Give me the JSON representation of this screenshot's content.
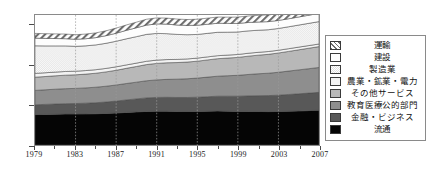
{
  "chart_data": {
    "type": "area",
    "stacked": true,
    "title": "",
    "xlabel": "",
    "ylabel": "",
    "x": [
      1979,
      1980,
      1981,
      1982,
      1983,
      1984,
      1985,
      1986,
      1987,
      1988,
      1989,
      1990,
      1991,
      1992,
      1993,
      1994,
      1995,
      1996,
      1997,
      1998,
      1999,
      2000,
      2001,
      2002,
      2003,
      2004,
      2005,
      2006,
      2007
    ],
    "xlim": [
      1979,
      2007
    ],
    "ylim": [
      0,
      3250
    ],
    "yticks": [
      0,
      1000,
      2000,
      3000
    ],
    "xticks": [
      1979,
      1983,
      1987,
      1991,
      1995,
      1999,
      2003,
      2007
    ],
    "grid": "vertical-dotted",
    "legend_position": "right",
    "series": [
      {
        "name": "流通",
        "order_from_bottom": 1,
        "color": "#050505",
        "pattern": "solid",
        "values": [
          760,
          765,
          770,
          775,
          775,
          778,
          782,
          790,
          800,
          815,
          828,
          840,
          845,
          845,
          840,
          838,
          840,
          845,
          850,
          845,
          840,
          840,
          838,
          835,
          838,
          845,
          852,
          860,
          868
        ]
      },
      {
        "name": "金融・ビジネス",
        "order_from_bottom": 2,
        "color": "#585858",
        "pattern": "solid",
        "values": [
          245,
          250,
          255,
          258,
          262,
          268,
          275,
          285,
          298,
          312,
          325,
          338,
          345,
          348,
          348,
          350,
          355,
          362,
          370,
          375,
          380,
          388,
          395,
          400,
          408,
          418,
          428,
          438,
          448
        ]
      },
      {
        "name": "教育医療公的部門",
        "order_from_bottom": 3,
        "color": "#8e8e8e",
        "pattern": "solid",
        "values": [
          360,
          365,
          370,
          375,
          378,
          382,
          388,
          395,
          402,
          410,
          418,
          428,
          438,
          448,
          458,
          468,
          478,
          490,
          500,
          512,
          522,
          535,
          548,
          560,
          572,
          585,
          598,
          610,
          622
        ]
      },
      {
        "name": "その他サービス",
        "order_from_bottom": 4,
        "color": "#b8b8b8",
        "pattern": "solid",
        "values": [
          330,
          332,
          335,
          338,
          340,
          344,
          350,
          358,
          368,
          380,
          392,
          405,
          412,
          415,
          415,
          418,
          422,
          430,
          438,
          442,
          448,
          458,
          465,
          472,
          482,
          492,
          502,
          512,
          522
        ]
      },
      {
        "name": "農業・鉱業・電力",
        "order_from_bottom": 5,
        "color": "#f2f2f2",
        "pattern": "solid",
        "values": [
          95,
          94,
          93,
          92,
          90,
          89,
          88,
          87,
          86,
          85,
          84,
          83,
          82,
          80,
          79,
          78,
          77,
          76,
          75,
          74,
          73,
          72,
          71,
          70,
          69,
          68,
          67,
          66,
          65
        ]
      },
      {
        "name": "製造業",
        "order_from_bottom": 6,
        "color": "#ededed",
        "pattern": "checker-light",
        "values": [
          690,
          672,
          655,
          640,
          622,
          618,
          620,
          628,
          640,
          652,
          662,
          672,
          668,
          648,
          625,
          605,
          592,
          588,
          585,
          572,
          562,
          560,
          552,
          545,
          545,
          548,
          552,
          556,
          560
        ]
      },
      {
        "name": "建設",
        "order_from_bottom": 7,
        "color": "#fdfdfd",
        "pattern": "solid",
        "values": [
          192,
          188,
          184,
          180,
          176,
          178,
          182,
          190,
          200,
          212,
          222,
          232,
          238,
          238,
          235,
          232,
          230,
          228,
          226,
          220,
          214,
          210,
          206,
          202,
          200,
          200,
          202,
          204,
          206
        ]
      },
      {
        "name": "運輸",
        "order_from_bottom": 8,
        "color": "#e4e4e4",
        "pattern": "hatch-diagonal",
        "values": [
          118,
          117,
          116,
          115,
          114,
          116,
          118,
          122,
          128,
          134,
          140,
          146,
          150,
          150,
          148,
          148,
          150,
          152,
          155,
          156,
          158,
          162,
          165,
          168,
          172,
          176,
          180,
          184,
          188
        ]
      }
    ]
  },
  "axes": {
    "y_ticks": [
      {
        "value": 0,
        "label": "0"
      },
      {
        "value": 1000,
        "label": "1000"
      },
      {
        "value": 2000,
        "label": "2000"
      },
      {
        "value": 3000,
        "label": "3000"
      }
    ],
    "x_ticks": [
      {
        "value": 1979,
        "label": "1979"
      },
      {
        "value": 1983,
        "label": "1983"
      },
      {
        "value": 1987,
        "label": "1987"
      },
      {
        "value": 1991,
        "label": "1991"
      },
      {
        "value": 1995,
        "label": "1995"
      },
      {
        "value": 1999,
        "label": "1999"
      },
      {
        "value": 2003,
        "label": "2003"
      },
      {
        "value": 2007,
        "label": "2007"
      }
    ]
  },
  "legend": {
    "items": [
      {
        "label": "運輸",
        "color": "#e4e4e4",
        "pattern": "hatch-diagonal"
      },
      {
        "label": "建設",
        "color": "#fdfdfd",
        "pattern": "solid"
      },
      {
        "label": "製造業",
        "color": "#ededed",
        "pattern": "checker-light"
      },
      {
        "label": "農業・鉱業・電力",
        "color": "#f2f2f2",
        "pattern": "solid"
      },
      {
        "label": "その他サービス",
        "color": "#b8b8b8",
        "pattern": "solid"
      },
      {
        "label": "教育医療公的部門",
        "color": "#8e8e8e",
        "pattern": "solid"
      },
      {
        "label": "金融・ビジネス",
        "color": "#585858",
        "pattern": "solid"
      },
      {
        "label": "流通",
        "color": "#050505",
        "pattern": "solid"
      }
    ]
  }
}
